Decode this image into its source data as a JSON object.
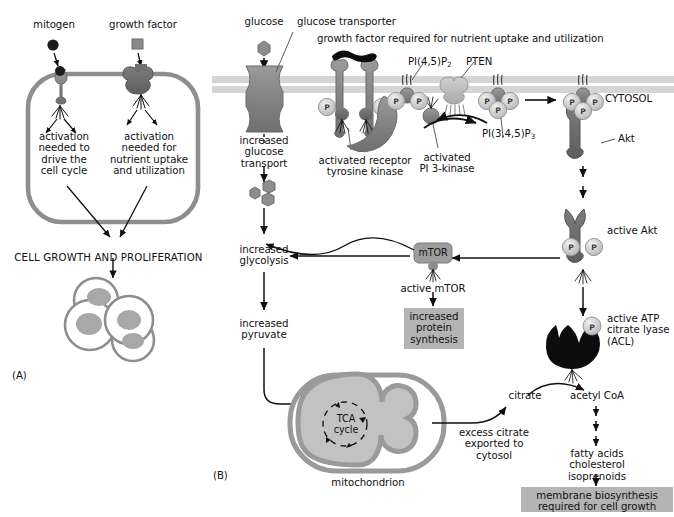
{
  "figure": {
    "panel_a_label": "(A)",
    "panel_b_label": "(B)"
  },
  "panel_a": {
    "ligands": [
      {
        "name": "mitogen",
        "label": "mitogen",
        "shape": "circle",
        "color": "#1c1c1c"
      },
      {
        "name": "growth-factor",
        "label": "growth factor",
        "shape": "square",
        "color": "#808080"
      }
    ],
    "boxes": [
      {
        "name": "activation-cell-cycle",
        "label": "activation\nneeded to\ndrive the\ncell cycle"
      },
      {
        "name": "activation-nutrient-uptake",
        "label": "activation\nneeded for\nnutrient uptake\nand utilization"
      }
    ],
    "outcome": "CELL GROWTH AND PROLIFERATION",
    "cluster_label": "dividing cells"
  },
  "panel_b": {
    "compartment_label": "CYTOSOL",
    "top_note": "growth factor required for nutrient uptake and utilization",
    "labels": {
      "glucose": "glucose",
      "glucose_transporter": "glucose transporter",
      "increased_glucose_transport": "increased\nglucose\ntransport",
      "activated_rtk": "activated receptor\ntyrosine kinase",
      "pi45p2": "PI(4,5)P",
      "pi45p2_sub": "2",
      "pten": "PTEN",
      "activated_pi3k": "activated\nPI 3-kinase",
      "pi345p3": "PI(3,4,5)P",
      "pi345p3_sub": "3",
      "akt": "Akt",
      "active_akt": "active Akt",
      "increased_glycolysis": "increased\nglycolysis",
      "increased_pyruvate": "increased\npyruvate",
      "mtor": "mTOR",
      "active_mtor": "active mTOR",
      "increased_protein_synthesis": "increased\nprotein\nsynthesis",
      "active_acl": "active ATP\ncitrate lyase\n(ACL)",
      "citrate": "citrate",
      "acetyl_coa": "acetyl CoA",
      "tca_cycle": "TCA\ncycle",
      "mitochondrion": "mitochondrion",
      "excess_citrate": "excess citrate\nexported to\ncytosol",
      "lipid_products": "fatty acids\ncholesterol\nisoprenoids",
      "membrane_biosynthesis": "membrane biosynthesis\nrequired for cell growth",
      "phosphate": "P"
    }
  },
  "colors": {
    "membrane": "#d2d2d2",
    "protein_mid": "#8c8c8c",
    "protein_dark": "#6e6e6e",
    "protein_light": "#b9b9b9",
    "protein_black": "#101010",
    "highlight_box": "#b4b4b4",
    "line": "#101010"
  }
}
